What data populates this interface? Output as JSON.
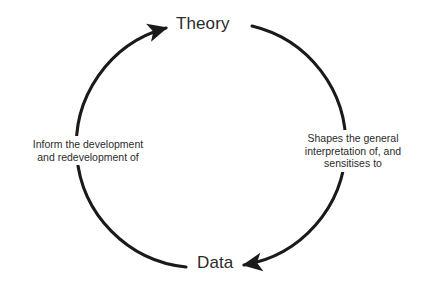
{
  "diagram": {
    "type": "cycle",
    "title_visible": false,
    "background_color": "#ffffff",
    "stroke_color": "#1a1a1a",
    "text_color": "#2b2b2b",
    "nodes": [
      {
        "id": "theory",
        "label": "Theory",
        "position": "top"
      },
      {
        "id": "data",
        "label": "Data",
        "position": "bottom"
      }
    ],
    "edges": [
      {
        "id": "data-to-theory",
        "from": "data",
        "to": "theory",
        "side": "left",
        "direction": "upward",
        "label": "Inform the development\nand redevelopment of",
        "label_lines": [
          "Inform the development",
          "and redevelopment of"
        ]
      },
      {
        "id": "theory-to-data",
        "from": "theory",
        "to": "data",
        "side": "right",
        "direction": "downward",
        "label": "Shapes the general\ninterpretation of, and\nsensitises to",
        "label_lines": [
          "Shapes the general",
          "interpretation of, and",
          "sensitises to"
        ]
      }
    ],
    "geometry": {
      "center_x": 204,
      "center_y": 146,
      "radius": 122,
      "stroke_width": 3
    }
  }
}
